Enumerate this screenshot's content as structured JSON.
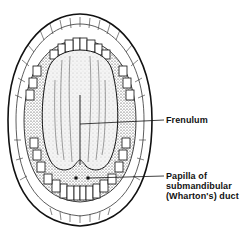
{
  "figure": {
    "colors": {
      "ink": "#111111",
      "background": "#ffffff",
      "shading": "#555555"
    }
  },
  "labels": {
    "frenulum": "Frenulum",
    "papilla": {
      "line1": "Papilla of",
      "line2": "submandibular",
      "line3": "(Wharton's) duct"
    }
  }
}
